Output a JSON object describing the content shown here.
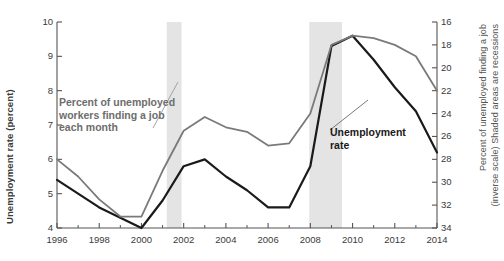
{
  "chart_data": {
    "type": "line",
    "title": "",
    "xlabel": "",
    "ylabel": "Unemployment rate (percent)",
    "y2label": "Percent of unemployed finding a job (inverse scale) Shaded areas are recessions",
    "x": [
      1996,
      1997,
      1998,
      1999,
      2000,
      2001,
      2002,
      2003,
      2004,
      2005,
      2006,
      2007,
      2008,
      2009,
      2010,
      2011,
      2012,
      2013,
      2014
    ],
    "xlim": [
      1996,
      2014
    ],
    "xticks": [
      1996,
      1998,
      2000,
      2002,
      2004,
      2006,
      2008,
      2010,
      2012,
      2014
    ],
    "ylim": [
      4,
      10
    ],
    "yticks": [
      4,
      5,
      6,
      7,
      8,
      9,
      10
    ],
    "y2lim": [
      34,
      16
    ],
    "y2ticks": [
      16,
      18,
      20,
      22,
      24,
      26,
      28,
      30,
      32,
      34
    ],
    "y2_inverted": true,
    "grid": false,
    "legend": "annotations",
    "series": [
      {
        "name": "Unemployment rate",
        "axis": "left",
        "color": "#1a1a1a",
        "width": 2.2,
        "values": [
          5.4,
          5.0,
          4.6,
          4.3,
          4.0,
          4.8,
          5.8,
          6.0,
          5.5,
          5.1,
          4.6,
          4.6,
          5.8,
          9.3,
          9.6,
          8.9,
          8.1,
          7.4,
          6.2
        ]
      },
      {
        "name": "Percent of unemployed workers finding a job each month",
        "axis": "right",
        "color": "#7a7a7a",
        "width": 1.8,
        "values": [
          28.0,
          29.5,
          31.5,
          33.0,
          33.0,
          29.0,
          25.5,
          24.3,
          25.2,
          25.6,
          26.8,
          26.6,
          24.0,
          18.0,
          17.2,
          17.4,
          18.0,
          19.0,
          22.0
        ]
      }
    ],
    "recessions": [
      {
        "start": 2001.2,
        "end": 2001.9,
        "color": "#e4e4e4"
      },
      {
        "start": 2007.95,
        "end": 2009.5,
        "color": "#e4e4e4"
      }
    ],
    "annotations": [
      {
        "id": "job-note",
        "text": "Percent of unemployed\nworkers finding a job\neach month",
        "color": "#6d6d6d"
      },
      {
        "id": "unemp-note",
        "text": "Unemployment\nrate",
        "color": "#1a1a1a"
      }
    ]
  },
  "axes": {
    "left_title": "Unemployment rate (percent)",
    "right_title_line1": "Percent of unemployed finding a job",
    "right_title_line2": "(inverse scale) Shaded areas are recessions",
    "left_ticks": [
      "10",
      "9",
      "8",
      "7",
      "6",
      "5",
      "4"
    ],
    "right_ticks": [
      "16",
      "18",
      "20",
      "22",
      "24",
      "26",
      "28",
      "30",
      "32",
      "34"
    ],
    "x_ticks": [
      "1996",
      "1998",
      "2000",
      "2002",
      "2004",
      "2006",
      "2008",
      "2010",
      "2012",
      "2014"
    ]
  },
  "annotations": {
    "job_note": "Percent of unemployed\nworkers finding a job\neach month",
    "unemp_note": "Unemployment\nrate"
  },
  "colors": {
    "unemployment_line": "#1a1a1a",
    "jobfinding_line": "#7a7a7a",
    "recession_band": "#e4e4e4",
    "axis": "#555555",
    "text": "#3a3a3a"
  }
}
